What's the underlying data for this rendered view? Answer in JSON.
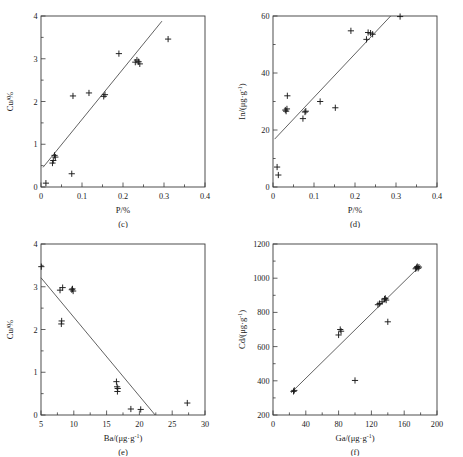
{
  "figure": {
    "background_color": "#ffffff",
    "ink_color": "#1a1a1a",
    "marker_symbol": "plus"
  },
  "chart_data": [
    {
      "id": "c",
      "type": "scatter",
      "panel_label": "(c)",
      "title": "",
      "xlabel": "P/%",
      "ylabel": "Cu/%",
      "xlim": [
        0,
        0.4
      ],
      "ylim": [
        0,
        4
      ],
      "xticks": [
        0,
        0.1,
        0.2,
        0.3,
        0.4
      ],
      "xticklabels": [
        "0",
        "0.1",
        "0.2",
        "0.3",
        "0.4"
      ],
      "xminorticks": [
        0.05,
        0.15,
        0.25,
        0.35
      ],
      "yticks": [
        0,
        1,
        2,
        3,
        4
      ],
      "yticklabels": [
        "0",
        "1",
        "2",
        "3",
        "4"
      ],
      "yminorticks": [
        0.5,
        1.5,
        2.5,
        3.5
      ],
      "grid": false,
      "legend": false,
      "x": [
        0.012,
        0.028,
        0.03,
        0.033,
        0.035,
        0.075,
        0.078,
        0.117,
        0.153,
        0.156,
        0.19,
        0.23,
        0.234,
        0.238,
        0.241,
        0.31
      ],
      "y": [
        0.09,
        0.56,
        0.62,
        0.74,
        0.7,
        0.31,
        2.13,
        2.2,
        2.12,
        2.16,
        3.12,
        2.92,
        2.97,
        2.93,
        2.88,
        3.46
      ],
      "fit_line": {
        "x": [
          0.005,
          0.295
        ],
        "y": [
          0.46,
          3.88
        ]
      }
    },
    {
      "id": "d",
      "type": "scatter",
      "panel_label": "(d)",
      "title": "",
      "xlabel": "P/%",
      "ylabel": "In/(μg·g⁻¹)",
      "xlim": [
        0,
        0.4
      ],
      "ylim": [
        0,
        60
      ],
      "xticks": [
        0,
        0.1,
        0.2,
        0.3,
        0.4
      ],
      "xticklabels": [
        "0",
        "0.1",
        "0.2",
        "0.3",
        "0.4"
      ],
      "xminorticks": [
        0.05,
        0.15,
        0.25,
        0.35
      ],
      "yticks": [
        0,
        20,
        40,
        60
      ],
      "yticklabels": [
        "0",
        "20",
        "40",
        "60"
      ],
      "yminorticks": [
        10,
        30,
        50
      ],
      "grid": false,
      "legend": false,
      "x": [
        0.01,
        0.013,
        0.03,
        0.032,
        0.034,
        0.035,
        0.073,
        0.078,
        0.08,
        0.115,
        0.152,
        0.19,
        0.228,
        0.232,
        0.238,
        0.243,
        0.31
      ],
      "y": [
        7.0,
        4.2,
        27.0,
        26.6,
        27.4,
        32.0,
        24.0,
        26.3,
        26.6,
        30.0,
        27.8,
        54.8,
        51.8,
        54.2,
        54.0,
        53.6,
        59.8
      ],
      "fit_line": {
        "x": [
          0.004,
          0.287
        ],
        "y": [
          16.8,
          60.0
        ]
      }
    },
    {
      "id": "e",
      "type": "scatter",
      "panel_label": "(e)",
      "title": "",
      "xlabel": "Ba/(μg·g⁻¹)",
      "ylabel": "Cu/%",
      "xlim": [
        5,
        30
      ],
      "ylim": [
        0,
        4
      ],
      "xticks": [
        5,
        10,
        15,
        20,
        25,
        30
      ],
      "xticklabels": [
        "5",
        "10",
        "15",
        "20",
        "25",
        "30"
      ],
      "xminorticks": [
        7.5,
        12.5,
        17.5,
        22.5,
        27.5
      ],
      "yticks": [
        0,
        1,
        2,
        3,
        4
      ],
      "yticklabels": [
        "0",
        "1",
        "2",
        "3",
        "4"
      ],
      "yminorticks": [
        0.5,
        1.5,
        2.5,
        3.5
      ],
      "grid": false,
      "legend": false,
      "x": [
        5.05,
        7.9,
        8.1,
        8.15,
        8.3,
        9.7,
        9.8,
        9.9,
        16.5,
        16.6,
        16.7,
        16.65,
        18.7,
        20.2,
        27.3
      ],
      "y": [
        3.47,
        2.92,
        2.13,
        2.2,
        2.98,
        2.93,
        2.95,
        2.9,
        0.78,
        0.66,
        0.62,
        0.55,
        0.14,
        0.13,
        0.28
      ],
      "fit_line": {
        "x": [
          5.0,
          22.4
        ],
        "y": [
          3.21,
          0.0
        ]
      }
    },
    {
      "id": "f",
      "type": "scatter",
      "panel_label": "(f)",
      "title": "",
      "xlabel": "Ga/(μg·g⁻¹)",
      "ylabel": "Cd/(μg·g⁻¹)",
      "xlim": [
        0,
        200
      ],
      "ylim": [
        200,
        1200
      ],
      "xticks": [
        0,
        40,
        80,
        120,
        160,
        200
      ],
      "xticklabels": [
        "0",
        "40",
        "80",
        "120",
        "160",
        "200"
      ],
      "xminorticks": [
        20,
        60,
        100,
        140,
        180
      ],
      "yticks": [
        200,
        400,
        600,
        800,
        1000,
        1200
      ],
      "yticklabels": [
        "200",
        "400",
        "600",
        "800",
        "1000",
        "1200"
      ],
      "yminorticks": [
        300,
        500,
        700,
        900,
        1100
      ],
      "grid": false,
      "legend": false,
      "x": [
        25,
        26,
        80,
        82,
        83,
        100,
        128,
        130,
        133,
        136,
        137,
        138,
        140,
        174,
        175,
        176,
        177,
        178
      ],
      "y": [
        338,
        344,
        668,
        700,
        690,
        402,
        845,
        852,
        862,
        878,
        882,
        872,
        745,
        1055,
        1062,
        1068,
        1058,
        1065
      ],
      "fit_line": {
        "x": [
          22,
          180
        ],
        "y": [
          330,
          1075
        ]
      }
    }
  ]
}
